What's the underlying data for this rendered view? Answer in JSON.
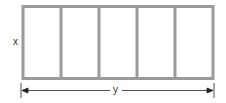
{
  "diagram": {
    "type": "rectangle divided into equal vertical sections",
    "sections": 5,
    "height_label": "x",
    "width_label": "y",
    "frame_color": "#9a9a9a",
    "arrow_color": "#222222"
  }
}
